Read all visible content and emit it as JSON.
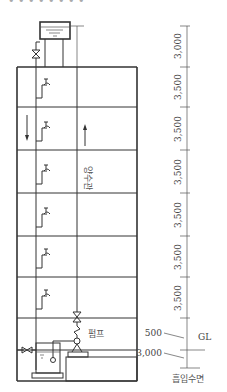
{
  "title_fragment": "• • • • • • • •",
  "diagram": {
    "type": "elevated-tank water supply system",
    "labels": {
      "riser": "양수관",
      "pump": "펌프",
      "ground_level": "GL",
      "intake_level": "흡입수면"
    },
    "dimensions": {
      "floor_heights": [
        "3,000",
        "3,500",
        "3,500",
        "3,500",
        "3,500",
        "3,500",
        "3,500"
      ],
      "gl_offset": "500",
      "suction_depth": "3,000"
    },
    "floors": 6,
    "colors": {
      "line": "#333333",
      "text": "#444444",
      "background": "#ffffff"
    }
  }
}
